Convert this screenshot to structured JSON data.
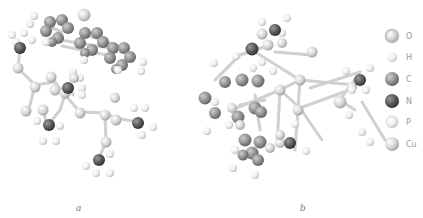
{
  "figure": {
    "panels": [
      {
        "id": "a",
        "label": "a",
        "label_pos": [
          76,
          203
        ]
      },
      {
        "id": "b",
        "label": "b",
        "label_pos": [
          300,
          203
        ]
      }
    ]
  },
  "legend": {
    "items": [
      {
        "element": "O",
        "label": "O",
        "color": "#c9c9c9",
        "ring": true,
        "y": 36
      },
      {
        "element": "H",
        "label": "H",
        "color": "#efefef",
        "ring": false,
        "y": 56
      },
      {
        "element": "C",
        "label": "C",
        "color": "#8a8a8a",
        "ring": false,
        "y": 78
      },
      {
        "element": "N",
        "label": "N",
        "color": "#555555",
        "ring": false,
        "y": 100
      },
      {
        "element": "P",
        "label": "P",
        "color": "#e9e9e9",
        "ring": false,
        "y": 121
      },
      {
        "element": "Cu",
        "label": "Cu",
        "color": "#bdbdbd",
        "ring": false,
        "y": 143
      }
    ]
  },
  "colors": {
    "O": "#d2d2d2",
    "H": "#efefef",
    "C": "#8c8c8c",
    "N": "#555555",
    "P": "#e6e6e6",
    "Cu": "#bcbcbc",
    "bond": "#d4d4d4"
  }
}
